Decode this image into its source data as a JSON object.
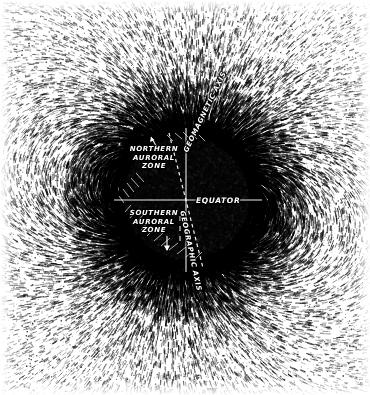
{
  "figure": {
    "kind": "iron-filings-magnetic-field-photograph",
    "width": 370,
    "height": 395,
    "background_color": "#ffffff",
    "filings_color": "#000000",
    "sphere_color": "#050505"
  },
  "sphere": {
    "center_x": 186,
    "center_y": 200,
    "radius": 68
  },
  "labels": {
    "northern_auroral_zone": "NORTHERN\nAURORAL\nZONE",
    "northern_auroral_zone_lines": [
      "NORTHERN",
      "AURORAL",
      "ZONE"
    ],
    "southern_auroral_zone": "SOUTHERN\nAURORAL\nZONE",
    "southern_auroral_zone_lines": [
      "SOUTHERN",
      "AURORAL",
      "ZONE"
    ],
    "equator": "EQUATOR",
    "geomagnetic_axis": "GEOMAGNETIC AXIS",
    "geographic_axis": "GEOGRAPHIC AXIS"
  },
  "axes": {
    "geomagnetic": {
      "style": "dashed",
      "tilt_degrees": 14,
      "color": "#ffffff"
    },
    "geographic": {
      "style": "solid",
      "tilt_degrees": 0,
      "color": "#ffffff"
    },
    "equator": {
      "style": "solid",
      "color": "#ffffff"
    }
  },
  "markers": {
    "northern_arrow": "arrow-up-left",
    "southern_arrow": "arrow-down",
    "hatching": "equator-band-hatch"
  },
  "chart_data": {
    "type": "scatter",
    "xlabel": "",
    "ylabel": "",
    "categories": [
      "NORTHERN AURORAL ZONE",
      "SOUTHERN AURORAL ZONE",
      "EQUATOR",
      "GEOMAGNETIC AXIS",
      "GEOGRAPHIC AXIS"
    ],
    "values": [
      1,
      1,
      1,
      1,
      1
    ],
    "annotations": [
      {
        "text": "NORTHERN AURORAL ZONE",
        "x": 154,
        "y": 160
      },
      {
        "text": "SOUTHERN AURORAL ZONE",
        "x": 154,
        "y": 224
      },
      {
        "text": "EQUATOR",
        "x": 220,
        "y": 201
      },
      {
        "text": "GEOMAGNETIC AXIS",
        "x": 206,
        "y": 175
      },
      {
        "text": "GEOGRAPHIC AXIS",
        "x": 198,
        "y": 232
      }
    ],
    "grid": false,
    "legend_position": "none"
  }
}
